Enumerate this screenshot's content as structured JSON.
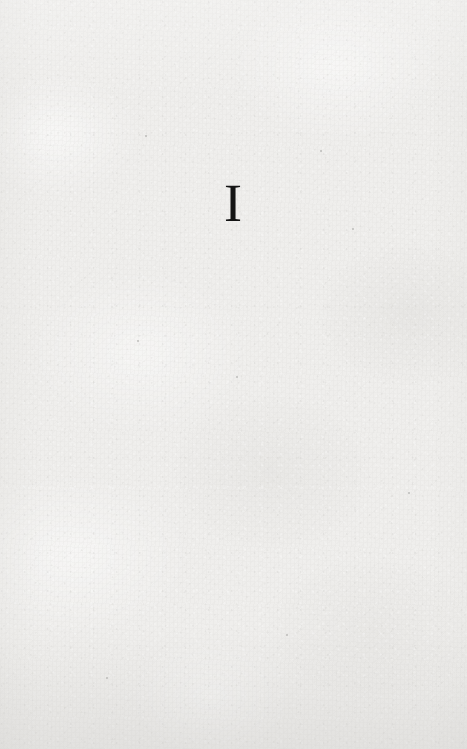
{
  "page": {
    "kind": "part-title-page",
    "paper_color": "#efeeec",
    "ink_color": "#141414",
    "width": 467,
    "height": 749
  },
  "content": {
    "part_numeral": "I"
  },
  "specks": [
    {
      "x": 145,
      "y": 135,
      "size": 2
    },
    {
      "x": 320,
      "y": 150,
      "size": 2
    },
    {
      "x": 352,
      "y": 228,
      "size": 2
    },
    {
      "x": 236,
      "y": 376,
      "size": 2
    },
    {
      "x": 137,
      "y": 340,
      "size": 2
    },
    {
      "x": 286,
      "y": 634,
      "size": 2
    },
    {
      "x": 106,
      "y": 677,
      "size": 2
    },
    {
      "x": 408,
      "y": 492,
      "size": 2
    }
  ]
}
